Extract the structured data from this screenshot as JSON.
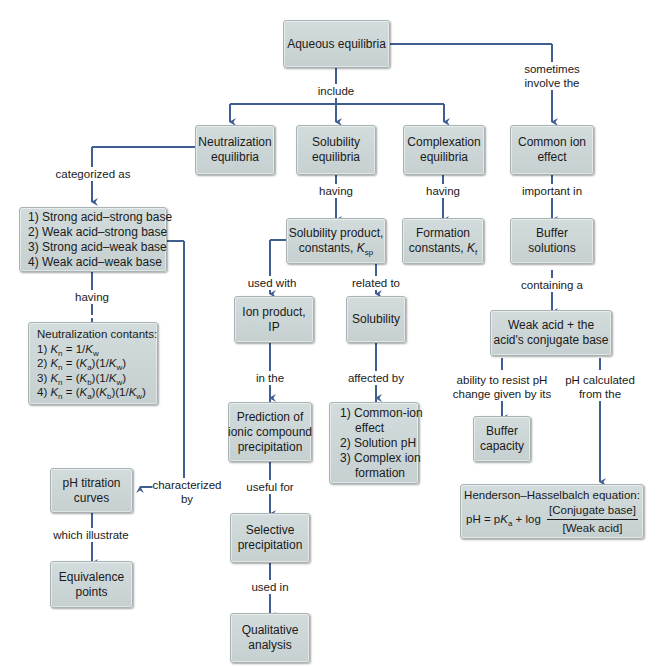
{
  "diagram": {
    "colors": {
      "box_fill": "#ccd5d6",
      "box_border": "#a9b3b4",
      "connector": "#3f5f93",
      "text": "#1a1a1a",
      "background": "#ffffff"
    },
    "nodes": {
      "root": "Aqueous equilibria",
      "neutralization": [
        "Neutralization",
        "equilibria"
      ],
      "solubility": [
        "Solubility",
        "equilibria"
      ],
      "complexation": [
        "Complexation",
        "equilibria"
      ],
      "common_ion": [
        "Common ion",
        "effect"
      ],
      "acid_base_types": [
        "1) Strong acid–strong base",
        "2) Weak acid–strong base",
        "3) Strong acid–weak base",
        "4) Weak acid–weak base"
      ],
      "neutralization_constants": {
        "heading": "Neutralization contants:",
        "items": [
          "1) K_n = 1/K_w",
          "2) K_n = (K_a)(1/K_w)",
          "3) K_n = (K_b)(1/K_w)",
          "4) K_n = (K_a)(K_b)(1/K_w)"
        ]
      },
      "ksp": [
        "Solubility product,",
        "constants, K_sp"
      ],
      "formation": [
        "Formation",
        "constants, K_f"
      ],
      "buffer_solutions": [
        "Buffer",
        "solutions"
      ],
      "weak_acid_pair": [
        "Weak acid + the",
        "acid's conjugate base"
      ],
      "ion_product": "Ion product, IP",
      "solubility_node": "Solubility",
      "prediction": [
        "Prediction of",
        "ionic compound",
        "precipitation"
      ],
      "solubility_factors": [
        "1) Common-ion",
        "effect",
        "2) Solution pH",
        "3) Complex ion",
        "formation"
      ],
      "buffer_capacity": [
        "Buffer",
        "capacity"
      ],
      "henderson": {
        "heading": "Henderson–Hasselbalch equation:",
        "lhs": "pH = pK_a + log",
        "numerator": "[Conjugate base]",
        "denominator": "[Weak acid]"
      },
      "ph_titration": [
        "pH titration",
        "curves"
      ],
      "equivalence": [
        "Equivalence",
        "points"
      ],
      "selective": [
        "Selective",
        "precipitation"
      ],
      "qualitative": [
        "Qualitative",
        "analysis"
      ]
    },
    "labels": {
      "include": "include",
      "sometimes": [
        "sometimes",
        "involve the"
      ],
      "categorized_as": "categorized as",
      "having_1": "having",
      "having_2": "having",
      "having_3": "having",
      "important_in": "important in",
      "containing_a": "containing a",
      "used_with": "used with",
      "related_to": "related to",
      "in_the": "in the",
      "affected_by": "affected by",
      "useful_for": "useful for",
      "used_in": "used in",
      "ability": [
        "ability to resist pH",
        "change given by its"
      ],
      "ph_calculated": [
        "pH calculated",
        "from the"
      ],
      "characterized_by": [
        "characterized",
        "by"
      ],
      "which_illustrate": "which illustrate"
    }
  }
}
